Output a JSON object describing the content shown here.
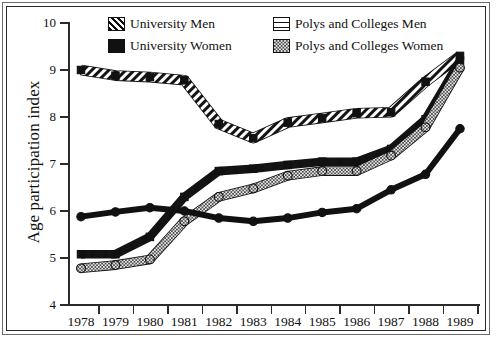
{
  "chart_data": {
    "type": "line",
    "title": "",
    "xlabel": "",
    "ylabel": "Age participation index",
    "categories": [
      "1978",
      "1979",
      "1980",
      "1981",
      "1982",
      "1983",
      "1984",
      "1985",
      "1986",
      "1987",
      "1988",
      "1989"
    ],
    "ylim": [
      4,
      10
    ],
    "yticks": [
      4,
      5,
      6,
      7,
      8,
      9,
      10
    ],
    "grid": false,
    "legend_position": "top-center",
    "series": [
      {
        "name": "University Men",
        "pattern": "diagonal-hatch",
        "values": [
          9.0,
          8.88,
          8.85,
          8.78,
          7.85,
          7.55,
          7.88,
          7.98,
          8.08,
          8.1,
          8.75,
          9.3
        ]
      },
      {
        "name": "University Women",
        "pattern": "solid-black",
        "values": [
          5.88,
          5.98,
          6.07,
          6.0,
          5.85,
          5.78,
          5.85,
          5.97,
          6.05,
          6.45,
          6.78,
          7.75
        ]
      },
      {
        "name": "Polys and Colleges Men",
        "pattern": "horizontal-lines",
        "values": [
          5.08,
          5.08,
          5.45,
          6.3,
          6.85,
          6.9,
          6.98,
          7.05,
          7.05,
          7.32,
          7.95,
          9.2
        ]
      },
      {
        "name": "Polys and Colleges Women",
        "pattern": "checkered-gray",
        "values": [
          4.78,
          4.85,
          4.97,
          5.78,
          6.3,
          6.48,
          6.75,
          6.85,
          6.85,
          7.18,
          7.78,
          9.05
        ]
      }
    ]
  },
  "legend": {
    "items": [
      {
        "label": "University Men"
      },
      {
        "label": "Polys and Colleges Men"
      },
      {
        "label": "University Women"
      },
      {
        "label": "Polys and Colleges Women"
      }
    ]
  }
}
